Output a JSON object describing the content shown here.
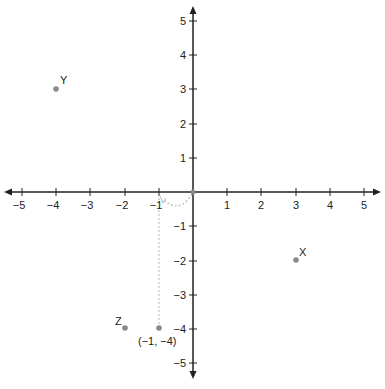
{
  "diagram": {
    "type": "coordinate-plane",
    "x_range": [
      -5,
      5
    ],
    "y_range": [
      -5,
      5
    ],
    "axis_color": "#222222",
    "point_color": "#8a8a8a",
    "dash_color": "#b0b0b0",
    "x_tick_labels": [
      "−5",
      "−4",
      "−3",
      "−2",
      "−1",
      "1",
      "2",
      "3",
      "4",
      "5"
    ],
    "y_tick_labels": [
      "5",
      "4",
      "3",
      "2",
      "1",
      "−1",
      "−2",
      "−3",
      "−4",
      "−5"
    ],
    "points": [
      {
        "name": "Y",
        "x": -4,
        "y": 3,
        "label": "Y"
      },
      {
        "name": "X",
        "x": 3,
        "y": -2,
        "label": "X"
      },
      {
        "name": "Z",
        "x": -2,
        "y": -4,
        "label": "Z"
      },
      {
        "name": "P",
        "x": -1,
        "y": -4,
        "label": "(−1, −4)"
      },
      {
        "name": "O",
        "x": 0,
        "y": 0,
        "label": ""
      }
    ],
    "annotations": [
      {
        "type": "dashed-arc",
        "from": [
          0,
          0
        ],
        "to": [
          -1,
          0
        ]
      },
      {
        "type": "dotted-line",
        "from": [
          -1,
          -4
        ],
        "to": [
          -1,
          0
        ]
      }
    ]
  }
}
